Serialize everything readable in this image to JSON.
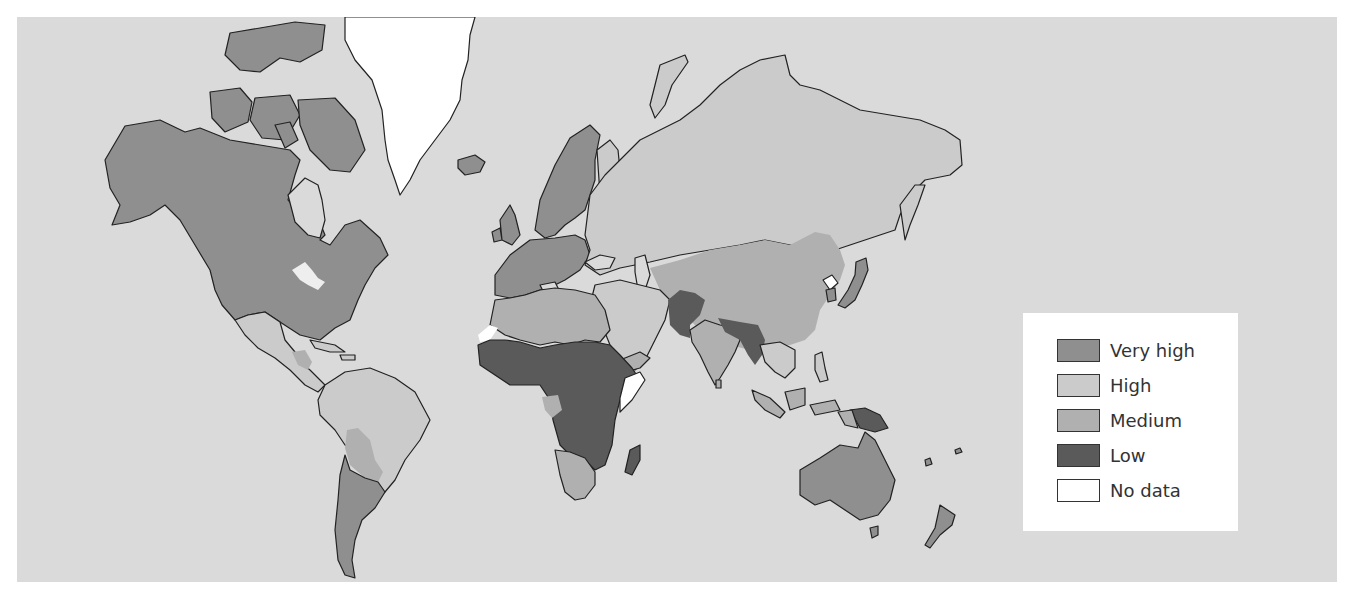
{
  "map": {
    "background_color": "#dadada",
    "outline_color": "#222222",
    "categories": {
      "very_high": "#8f8f8f",
      "high": "#cbcbcb",
      "medium": "#b0b0b0",
      "low": "#5a5a5a",
      "no_data": "#ffffff"
    },
    "regions": [
      {
        "name": "North America (Canada, USA, Alaska)",
        "class": "very_high"
      },
      {
        "name": "Greenland",
        "class": "no_data"
      },
      {
        "name": "Iceland",
        "class": "very_high"
      },
      {
        "name": "Mexico & Caribbean",
        "class": "high"
      },
      {
        "name": "Central America (Guatemala/Honduras)",
        "class": "medium"
      },
      {
        "name": "South America (Brazil, Colombia, Peru, Venezuela)",
        "class": "high"
      },
      {
        "name": "Bolivia / Paraguay",
        "class": "medium"
      },
      {
        "name": "Argentina / Chile / Uruguay",
        "class": "very_high"
      },
      {
        "name": "Western & Northern Europe",
        "class": "very_high"
      },
      {
        "name": "Eastern Europe & Russia",
        "class": "high"
      },
      {
        "name": "North Africa (Morocco, Algeria, Libya, Egypt)",
        "class": "medium"
      },
      {
        "name": "Western Sahara",
        "class": "no_data"
      },
      {
        "name": "Sub-Saharan Africa",
        "class": "low"
      },
      {
        "name": "Somalia",
        "class": "no_data"
      },
      {
        "name": "Gabon / Congo",
        "class": "medium"
      },
      {
        "name": "Southern Africa (South Africa, Namibia, Botswana)",
        "class": "medium"
      },
      {
        "name": "Madagascar",
        "class": "low"
      },
      {
        "name": "Middle East (Saudi Arabia, Iran, Turkey)",
        "class": "high"
      },
      {
        "name": "Yemen",
        "class": "medium"
      },
      {
        "name": "Central Asia (Kazakhstan etc.)",
        "class": "medium"
      },
      {
        "name": "Afghanistan / Pakistan",
        "class": "low"
      },
      {
        "name": "India",
        "class": "medium"
      },
      {
        "name": "Nepal / Bangladesh / Myanmar",
        "class": "low"
      },
      {
        "name": "China / Mongolia",
        "class": "medium"
      },
      {
        "name": "North Korea",
        "class": "no_data"
      },
      {
        "name": "South Korea",
        "class": "very_high"
      },
      {
        "name": "Japan",
        "class": "very_high"
      },
      {
        "name": "Southeast Asia (Indochina, Philippines)",
        "class": "high"
      },
      {
        "name": "Indonesia / Malaysia",
        "class": "medium"
      },
      {
        "name": "Papua New Guinea",
        "class": "low"
      },
      {
        "name": "Australia",
        "class": "very_high"
      },
      {
        "name": "New Zealand",
        "class": "very_high"
      }
    ]
  },
  "legend": {
    "items": [
      {
        "label": "Very high",
        "color": "#8f8f8f"
      },
      {
        "label": "High",
        "color": "#cbcbcb"
      },
      {
        "label": "Medium",
        "color": "#b0b0b0"
      },
      {
        "label": "Low",
        "color": "#5a5a5a"
      },
      {
        "label": "No data",
        "color": "#ffffff"
      }
    ]
  }
}
